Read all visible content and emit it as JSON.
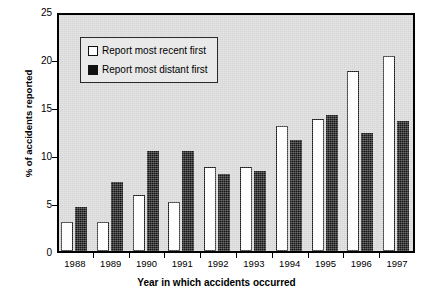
{
  "chart_data": {
    "type": "bar",
    "title": "",
    "xlabel": "Year in which accidents occurred",
    "ylabel": "% of accidents reported",
    "categories": [
      "1988",
      "1989",
      "1990",
      "1991",
      "1992",
      "1993",
      "1994",
      "1995",
      "1996",
      "1997"
    ],
    "series": [
      {
        "name": "Report most recent first",
        "color": "#ffffff",
        "values": [
          3.0,
          3.0,
          5.8,
          5.1,
          8.8,
          8.7,
          13.0,
          13.8,
          18.8,
          20.3
        ]
      },
      {
        "name": "Report most distant first",
        "color": "#101010",
        "values": [
          4.6,
          7.2,
          10.4,
          10.4,
          8.0,
          8.3,
          11.6,
          14.2,
          12.3,
          13.5
        ]
      }
    ],
    "ylim": [
      0,
      25
    ],
    "yticks": [
      "0",
      "5",
      "10",
      "15",
      "20",
      "25"
    ],
    "ytick_values": [
      0,
      5,
      10,
      15,
      20,
      25
    ],
    "grid": false,
    "legend_position": "inside-top-center",
    "plot_background": "#d6d6d6",
    "page_background": "#ffffff"
  },
  "legend": {
    "items": [
      {
        "label": "Report most recent first",
        "swatch": "hollow-square-icon"
      },
      {
        "label": "Report most distant first",
        "swatch": "filled-square-icon"
      }
    ]
  }
}
